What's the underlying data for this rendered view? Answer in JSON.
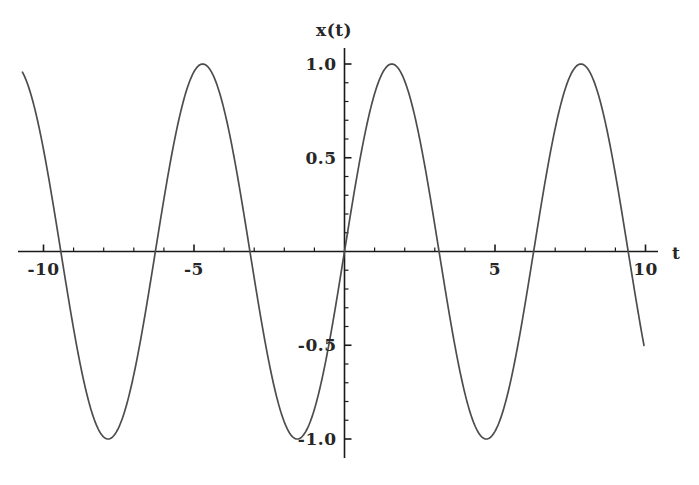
{
  "chart_data": {
    "type": "line",
    "title": "",
    "xlabel": "t",
    "ylabel": "x(t)",
    "xlim": [
      -10.7,
      9.95
    ],
    "ylim": [
      -1.12,
      1.12
    ],
    "grid": false,
    "legend": null,
    "function": "x(t) = sin(t)",
    "series": [
      {
        "name": "x(t)",
        "color": "#4d4d4d",
        "x": [
          -10.7,
          -10.5,
          -10.2,
          -10.0,
          -9.7,
          -9.42,
          -9.0,
          -8.64,
          -8.2,
          -7.85,
          -7.5,
          -7.07,
          -6.6,
          -6.28,
          -5.9,
          -5.5,
          -5.1,
          -4.71,
          -4.3,
          -3.9,
          -3.5,
          -3.14,
          -2.8,
          -2.4,
          -2.0,
          -1.57,
          -1.2,
          -0.8,
          -0.4,
          0.0,
          0.4,
          0.8,
          1.2,
          1.57,
          2.0,
          2.4,
          2.8,
          3.14,
          3.5,
          3.9,
          4.3,
          4.71,
          5.1,
          5.5,
          5.9,
          6.28,
          6.6,
          7.07,
          7.5,
          7.85,
          8.2,
          8.64,
          9.0,
          9.42,
          9.7,
          9.95
        ],
        "y": [
          0.9,
          0.88,
          0.71,
          0.54,
          0.27,
          0.0,
          -0.41,
          -0.72,
          -0.94,
          -1.0,
          -0.94,
          -0.71,
          -0.31,
          0.0,
          0.37,
          0.71,
          0.93,
          1.0,
          0.92,
          0.69,
          0.35,
          0.0,
          -0.33,
          -0.68,
          -0.91,
          -1.0,
          -0.93,
          -0.72,
          -0.39,
          0.0,
          0.39,
          0.72,
          0.93,
          1.0,
          0.91,
          0.68,
          0.33,
          0.0,
          -0.35,
          -0.69,
          -0.92,
          -1.0,
          -0.93,
          -0.71,
          -0.37,
          0.0,
          0.31,
          0.71,
          0.94,
          1.0,
          0.94,
          0.72,
          0.41,
          0.0,
          -0.27,
          -0.51
        ]
      }
    ],
    "xticks": [
      {
        "value": -10,
        "label": "-10",
        "major": true
      },
      {
        "value": -9,
        "label": "",
        "major": false
      },
      {
        "value": -8,
        "label": "",
        "major": false
      },
      {
        "value": -7,
        "label": "",
        "major": false
      },
      {
        "value": -6,
        "label": "",
        "major": false
      },
      {
        "value": -5,
        "label": "-5",
        "major": true
      },
      {
        "value": -4,
        "label": "",
        "major": false
      },
      {
        "value": -3,
        "label": "",
        "major": false
      },
      {
        "value": -2,
        "label": "",
        "major": false
      },
      {
        "value": -1,
        "label": "",
        "major": false
      },
      {
        "value": 1,
        "label": "",
        "major": false
      },
      {
        "value": 2,
        "label": "",
        "major": false
      },
      {
        "value": 3,
        "label": "",
        "major": false
      },
      {
        "value": 4,
        "label": "",
        "major": false
      },
      {
        "value": 5,
        "label": "5",
        "major": true
      },
      {
        "value": 6,
        "label": "",
        "major": false
      },
      {
        "value": 7,
        "label": "",
        "major": false
      },
      {
        "value": 8,
        "label": "",
        "major": false
      },
      {
        "value": 9,
        "label": "",
        "major": false
      },
      {
        "value": 10,
        "label": "10",
        "major": true
      }
    ],
    "yticks": [
      {
        "value": 1.0,
        "label": "1.0",
        "major": true
      },
      {
        "value": 0.9,
        "label": "",
        "major": false
      },
      {
        "value": 0.8,
        "label": "",
        "major": false
      },
      {
        "value": 0.7,
        "label": "",
        "major": false
      },
      {
        "value": 0.6,
        "label": "",
        "major": false
      },
      {
        "value": 0.5,
        "label": "0.5",
        "major": true
      },
      {
        "value": 0.4,
        "label": "",
        "major": false
      },
      {
        "value": 0.3,
        "label": "",
        "major": false
      },
      {
        "value": 0.2,
        "label": "",
        "major": false
      },
      {
        "value": 0.1,
        "label": "",
        "major": false
      },
      {
        "value": -0.1,
        "label": "",
        "major": false
      },
      {
        "value": -0.2,
        "label": "",
        "major": false
      },
      {
        "value": -0.3,
        "label": "",
        "major": false
      },
      {
        "value": -0.4,
        "label": "",
        "major": false
      },
      {
        "value": -0.5,
        "label": "-0.5",
        "major": true
      },
      {
        "value": -0.6,
        "label": "",
        "major": false
      },
      {
        "value": -0.7,
        "label": "",
        "major": false
      },
      {
        "value": -0.8,
        "label": "",
        "major": false
      },
      {
        "value": -0.9,
        "label": "",
        "major": false
      },
      {
        "value": -1.0,
        "label": "-1.0",
        "major": true
      }
    ],
    "axis_color": "#1a1a1a",
    "curve_color": "#4d4d4d",
    "background": "#ffffff"
  }
}
